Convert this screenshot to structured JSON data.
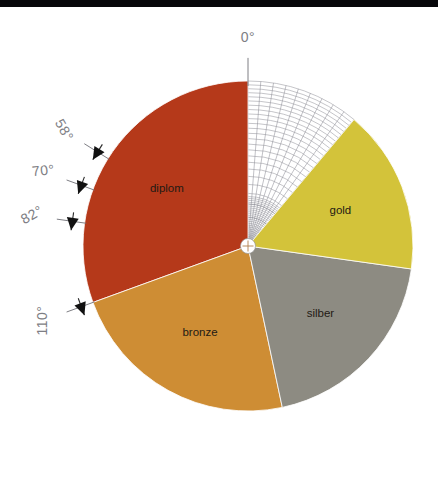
{
  "figure": {
    "background_color": "#ffffff",
    "top_bar_color": "#07070a",
    "center": {
      "x": 248,
      "y": 246
    },
    "radius": 165
  },
  "chart_data": {
    "type": "pie",
    "title": "",
    "subtitle": "",
    "xlabel": "",
    "ylabel": "",
    "grid": true,
    "legend_position": "in-slice",
    "units": "degrees",
    "start_angle_label": "0°",
    "direction": "counter-clockwise",
    "total_degrees": 360,
    "categories": [
      "diplom",
      "bronze",
      "silber",
      "gold"
    ],
    "values": [
      110,
      82,
      70,
      58
    ],
    "series": [
      {
        "name": "Anteil",
        "values": [
          110,
          82,
          70,
          58
        ]
      }
    ],
    "slices": [
      {
        "label": "diplom",
        "value": 110,
        "value_label": "110°",
        "color": "#b5391a",
        "start_deg": 0,
        "end_deg": 110,
        "label_color": "#2b1510"
      },
      {
        "label": "bronze",
        "value": 82,
        "value_label": "82°",
        "color": "#ce8d34",
        "start_deg": 110,
        "end_deg": 192,
        "label_color": "#2b1d10"
      },
      {
        "label": "silber",
        "value": 70,
        "value_label": "70°",
        "color": "#8d8b82",
        "start_deg": 192,
        "end_deg": 262,
        "label_color": "#1e1e1e"
      },
      {
        "label": "gold",
        "value": 58,
        "value_label": "58°",
        "color": "#d3c33a",
        "start_deg": 262,
        "end_deg": 320,
        "label_color": "#2b2710"
      }
    ],
    "unfilled_sector": {
      "start_deg": 320,
      "end_deg": 360,
      "note": "grid region"
    },
    "axis_ticks": [
      {
        "label": "0°",
        "deg": 0,
        "rotation": 0
      },
      {
        "label": "110°",
        "deg": 110,
        "rotation": -90
      },
      {
        "label": "82°",
        "deg": 82,
        "rotation": -30
      },
      {
        "label": "70°",
        "deg": 70,
        "rotation": -6
      },
      {
        "label": "58°",
        "deg": 58,
        "rotation": 60
      }
    ],
    "grid_rings": 24,
    "grid_radials": 9,
    "grid_color": "#8a8a92",
    "slice_label_color": "#231a14"
  },
  "labels": {
    "zero": "0°",
    "a110": "110°",
    "a82": "82°",
    "a70": "70°",
    "a58": "58°",
    "diplom": "diplom",
    "bronze": "bronze",
    "silber": "silber",
    "gold": "gold"
  }
}
